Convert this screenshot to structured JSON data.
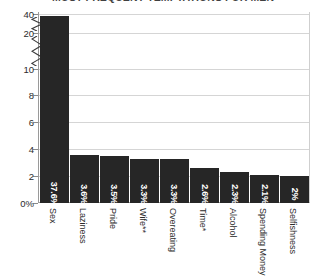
{
  "chart_data": {
    "type": "bar",
    "title": "MOST FREQUENT TEMPTATIONS FOR MEN",
    "xlabel": "",
    "ylabel": "",
    "categories": [
      "Sex",
      "Laziness",
      "Pride",
      "Wife**",
      "Overeating",
      "Time*",
      "Alcohol",
      "Spending Money",
      "Selfishness"
    ],
    "values": [
      37.6,
      3.6,
      3.5,
      3.3,
      3.3,
      2.6,
      2.3,
      2.1,
      2.0
    ],
    "value_labels": [
      "37.6%",
      "3.6%",
      "3.5%",
      "3.3%",
      "3.3%",
      "2.6%",
      "2.3%",
      "2.1%",
      "2%"
    ],
    "ytick_labels": [
      "0%",
      "2",
      "4",
      "6",
      "8",
      "10",
      "20",
      "40"
    ],
    "ytick_values": [
      0,
      2,
      4,
      6,
      8,
      10,
      20,
      40
    ],
    "axis_break": true,
    "axis_break_note": "Broken y-axis: linear 0-10, then compressed segments to 20 and 40",
    "ylim": [
      0,
      40
    ],
    "grid": true,
    "legend": false,
    "bar_color": "#262626",
    "value_label_color": "#FFFFFF",
    "gridline_color": "#D5D5D5",
    "axis_color": "#9A9A9A"
  }
}
